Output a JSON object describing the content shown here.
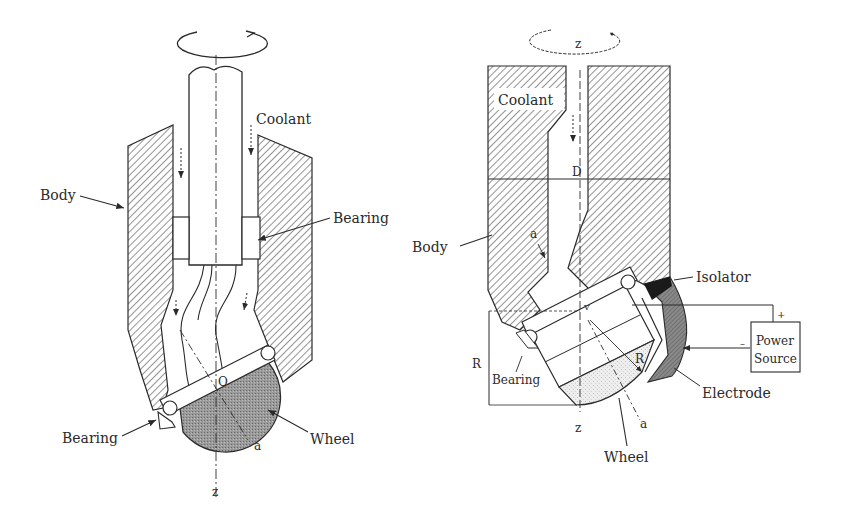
{
  "figure": {
    "left_diagram": {
      "labels": {
        "coolant": "Coolant",
        "body": "Body",
        "bearing_top": "Bearing",
        "bearing_bottom": "Bearing",
        "wheel": "Wheel",
        "center": "O",
        "axis_a": "a",
        "axis_z": "z"
      }
    },
    "right_diagram": {
      "labels": {
        "axis_z_top": "z",
        "coolant": "Coolant",
        "diameter": "D",
        "body": "Body",
        "axis_a_top": "a",
        "isolator": "Isolator",
        "v": "v",
        "power_source_line1": "Power",
        "power_source_line2": "Source",
        "plus": "+",
        "minus": "–",
        "radius_left": "R",
        "radius_inner": "R",
        "bearing": "Bearing",
        "electrode": "Electrode",
        "axis_z_bottom": "z",
        "axis_a_bottom": "a",
        "wheel": "Wheel"
      }
    },
    "colors": {
      "ink": "#2a2a2a",
      "hatch": "#3a3a3a",
      "wheel_fill": "#9a9a9a",
      "wheel_fill_light": "#dcdcdc",
      "electrode_fill": "#7a7a7a",
      "isolator_fill": "#1a1a1a",
      "background": "#ffffff"
    }
  }
}
